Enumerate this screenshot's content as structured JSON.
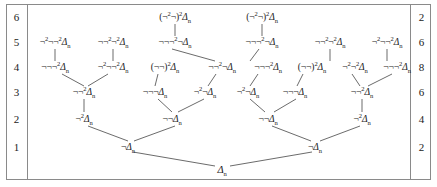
{
  "figure": {
    "frame_color": "#8a8a8a",
    "line_color": "#2b2b2b",
    "background": "#ffffff"
  },
  "left_gutter": {
    "name": "level-numbers",
    "values": [
      "6",
      "5",
      "4",
      "3",
      "2",
      "1"
    ]
  },
  "right_gutter": {
    "name": "node-counts",
    "values": [
      "2",
      "6",
      "8",
      "6",
      "4",
      "2"
    ]
  },
  "levels": [
    {
      "level": "6",
      "count": "2",
      "y": 17,
      "nodes": [
        {
          "id": "L6N1",
          "x": 175,
          "prefix": "(¬",
          "sup1": "2",
          "mid": "¬)",
          "sup2": "2",
          "base": "Δ",
          "sub": "n"
        },
        {
          "id": "L6N2",
          "x": 262,
          "prefix": "(¬",
          "sup1": "2",
          "mid": "¬)",
          "sup2": "2",
          "base": "Δ",
          "sub": "n"
        }
      ]
    },
    {
      "level": "5",
      "count": "6",
      "y": 42,
      "nodes": [
        {
          "id": "L5N1",
          "x": 55,
          "prefix": "¬",
          "sup1": "2",
          "mid": "¬¬",
          "sup2": "2",
          "base": "Δ",
          "sub": "n"
        },
        {
          "id": "L5N2",
          "x": 113,
          "prefix": "¬¬",
          "sup1": "2",
          "mid": "¬",
          "sup2": "2",
          "base": "Δ",
          "sub": "n"
        },
        {
          "id": "L5N3",
          "x": 175,
          "prefix": "¬¬¬",
          "sup1": "2",
          "mid": "¬",
          "sup2": "",
          "base": "Δ",
          "sub": "n"
        },
        {
          "id": "L5N4",
          "x": 262,
          "prefix": "¬¬¬",
          "sup1": "2",
          "mid": "¬",
          "sup2": "",
          "base": "Δ",
          "sub": "n"
        },
        {
          "id": "L5N5",
          "x": 330,
          "prefix": "¬¬",
          "sup1": "2",
          "mid": "¬",
          "sup2": "2",
          "base": "Δ",
          "sub": "n"
        },
        {
          "id": "L5N6",
          "x": 387,
          "prefix": "¬",
          "sup1": "2",
          "mid": "¬¬",
          "sup2": "2",
          "base": "Δ",
          "sub": "n"
        }
      ]
    },
    {
      "level": "4",
      "count": "8",
      "y": 67,
      "nodes": [
        {
          "id": "L4N1",
          "x": 55,
          "prefix": "¬¬¬",
          "sup1": "2",
          "mid": "",
          "sup2": "",
          "base": "Δ",
          "sub": "n"
        },
        {
          "id": "L4N2",
          "x": 113,
          "prefix": "¬",
          "sup1": "2",
          "mid": "¬¬",
          "sup2": "2",
          "base": "Δ",
          "sub": "n"
        },
        {
          "id": "L4N3",
          "x": 165,
          "prefix": "(¬¬)",
          "sup1": "2",
          "mid": "",
          "sup2": "",
          "base": "Δ",
          "sub": "n"
        },
        {
          "id": "L4N4",
          "x": 222,
          "prefix": "¬¬",
          "sup1": "2",
          "mid": "¬",
          "sup2": "",
          "base": "Δ",
          "sub": "n"
        },
        {
          "id": "L4N5",
          "x": 268,
          "prefix": "¬¬¬",
          "sup1": "2",
          "mid": "",
          "sup2": "",
          "base": "Δ",
          "sub": "n"
        },
        {
          "id": "L4N6",
          "x": 312,
          "prefix": "(¬¬)",
          "sup1": "2",
          "mid": "",
          "sup2": "",
          "base": "Δ",
          "sub": "n"
        },
        {
          "id": "L4N7",
          "x": 355,
          "prefix": "¬",
          "sup1": "2",
          "mid": "¬",
          "sup2": "2",
          "base": "Δ",
          "sub": "n"
        },
        {
          "id": "L4N8",
          "x": 397,
          "prefix": "¬¬¬",
          "sup1": "2",
          "mid": "",
          "sup2": "",
          "base": "Δ",
          "sub": "n"
        }
      ]
    },
    {
      "level": "3",
      "count": "6",
      "y": 92,
      "nodes": [
        {
          "id": "L3N1",
          "x": 84,
          "prefix": "¬¬",
          "sup1": "2",
          "mid": "",
          "sup2": "",
          "base": "Δ",
          "sub": "n"
        },
        {
          "id": "L3N2",
          "x": 155,
          "prefix": "¬¬¬",
          "sup1": "",
          "mid": "",
          "sup2": "",
          "base": "Δ",
          "sub": "n"
        },
        {
          "id": "L3N3",
          "x": 205,
          "prefix": "¬",
          "sup1": "2",
          "mid": "¬",
          "sup2": "",
          "base": "Δ",
          "sub": "n"
        },
        {
          "id": "L3N4",
          "x": 248,
          "prefix": "¬",
          "sup1": "2",
          "mid": "¬",
          "sup2": "",
          "base": "Δ",
          "sub": "n"
        },
        {
          "id": "L3N5",
          "x": 295,
          "prefix": "¬¬¬",
          "sup1": "",
          "mid": "",
          "sup2": "",
          "base": "Δ",
          "sub": "n"
        },
        {
          "id": "L3N6",
          "x": 362,
          "prefix": "¬¬",
          "sup1": "2",
          "mid": "",
          "sup2": "",
          "base": "Δ",
          "sub": "n"
        }
      ]
    },
    {
      "level": "2",
      "count": "4",
      "y": 119,
      "nodes": [
        {
          "id": "L2N1",
          "x": 84,
          "prefix": "¬",
          "sup1": "2",
          "mid": "",
          "sup2": "",
          "base": "Δ",
          "sub": "n"
        },
        {
          "id": "L2N2",
          "x": 172,
          "prefix": "¬¬",
          "sup1": "",
          "mid": "",
          "sup2": "",
          "base": "Δ",
          "sub": "n"
        },
        {
          "id": "L2N3",
          "x": 268,
          "prefix": "¬¬",
          "sup1": "",
          "mid": "",
          "sup2": "",
          "base": "Δ",
          "sub": "n"
        },
        {
          "id": "L2N4",
          "x": 362,
          "prefix": "¬",
          "sup1": "2",
          "mid": "",
          "sup2": "",
          "base": "Δ",
          "sub": "n"
        }
      ]
    },
    {
      "level": "1",
      "count": "2",
      "y": 147,
      "nodes": [
        {
          "id": "L1N1",
          "x": 128,
          "prefix": "¬",
          "sup1": "",
          "mid": "",
          "sup2": "",
          "base": "Δ",
          "sub": "n"
        },
        {
          "id": "L1N2",
          "x": 315,
          "prefix": "¬",
          "sup1": "",
          "mid": "",
          "sup2": "",
          "base": "Δ",
          "sub": "n"
        }
      ]
    },
    {
      "level": "0",
      "count": "",
      "y": 170,
      "nodes": [
        {
          "id": "L0N1",
          "x": 222,
          "prefix": "",
          "sup1": "",
          "mid": "",
          "sup2": "",
          "base": "Δ",
          "sub": "n"
        }
      ]
    }
  ],
  "edges": [
    {
      "from": "L6N1",
      "to": "L5N3",
      "x1": 175,
      "y1": 24,
      "x2": 175,
      "y2": 36
    },
    {
      "from": "L6N2",
      "to": "L5N4",
      "x1": 262,
      "y1": 24,
      "x2": 262,
      "y2": 36
    },
    {
      "from": "L5N1",
      "to": "L4N1",
      "x1": 55,
      "y1": 49,
      "x2": 55,
      "y2": 61
    },
    {
      "from": "L5N2",
      "to": "L4N2",
      "x1": 113,
      "y1": 49,
      "x2": 113,
      "y2": 61
    },
    {
      "from": "L5N3",
      "to": "L4N4",
      "x1": 172,
      "y1": 49,
      "x2": 215,
      "y2": 61
    },
    {
      "from": "L5N4",
      "to": "L4N5",
      "x1": 259,
      "y1": 49,
      "x2": 250,
      "y2": 61
    },
    {
      "from": "L5N5",
      "to": "L4N7",
      "x1": 330,
      "y1": 49,
      "x2": 330,
      "y2": 61
    },
    {
      "from": "L5N6",
      "to": "L4N8",
      "x1": 387,
      "y1": 49,
      "x2": 387,
      "y2": 61
    },
    {
      "from": "L4N1",
      "to": "L3N1",
      "x1": 62,
      "y1": 74,
      "x2": 84,
      "y2": 86
    },
    {
      "from": "L4N2",
      "to": "L3N1",
      "x1": 108,
      "y1": 74,
      "x2": 88,
      "y2": 86
    },
    {
      "from": "L4N3",
      "to": "L3N2",
      "x1": 158,
      "y1": 74,
      "x2": 155,
      "y2": 86
    },
    {
      "from": "L4N4",
      "to": "L3N3",
      "x1": 216,
      "y1": 74,
      "x2": 208,
      "y2": 86
    },
    {
      "from": "L4N5",
      "to": "L3N4",
      "x1": 258,
      "y1": 74,
      "x2": 250,
      "y2": 86
    },
    {
      "from": "L4N6",
      "to": "L3N5",
      "x1": 303,
      "y1": 74,
      "x2": 297,
      "y2": 86
    },
    {
      "from": "L4N7",
      "to": "L3N6",
      "x1": 352,
      "y1": 74,
      "x2": 360,
      "y2": 86
    },
    {
      "from": "L4N8",
      "to": "L3N6",
      "x1": 392,
      "y1": 74,
      "x2": 368,
      "y2": 86
    },
    {
      "from": "L3N1",
      "to": "L2N1",
      "x1": 84,
      "y1": 99,
      "x2": 84,
      "y2": 112
    },
    {
      "from": "L3N2",
      "to": "L2N2",
      "x1": 158,
      "y1": 99,
      "x2": 172,
      "y2": 112
    },
    {
      "from": "L3N3",
      "to": "L2N2",
      "x1": 204,
      "y1": 99,
      "x2": 178,
      "y2": 112
    },
    {
      "from": "L3N4",
      "to": "L2N3",
      "x1": 250,
      "y1": 99,
      "x2": 265,
      "y2": 112
    },
    {
      "from": "L3N5",
      "to": "L2N3",
      "x1": 296,
      "y1": 99,
      "x2": 274,
      "y2": 112
    },
    {
      "from": "L3N6",
      "to": "L2N4",
      "x1": 362,
      "y1": 99,
      "x2": 362,
      "y2": 112
    },
    {
      "from": "L2N1",
      "to": "L1N1",
      "x1": 88,
      "y1": 126,
      "x2": 128,
      "y2": 141
    },
    {
      "from": "L2N2",
      "to": "L1N1",
      "x1": 175,
      "y1": 126,
      "x2": 134,
      "y2": 141
    },
    {
      "from": "L2N3",
      "to": "L1N2",
      "x1": 272,
      "y1": 126,
      "x2": 311,
      "y2": 141
    },
    {
      "from": "L2N4",
      "to": "L1N2",
      "x1": 360,
      "y1": 126,
      "x2": 320,
      "y2": 141
    },
    {
      "from": "L1N1",
      "to": "L0N1",
      "x1": 133,
      "y1": 152,
      "x2": 215,
      "y2": 166
    },
    {
      "from": "L1N2",
      "to": "L0N1",
      "x1": 312,
      "y1": 152,
      "x2": 230,
      "y2": 166
    }
  ]
}
